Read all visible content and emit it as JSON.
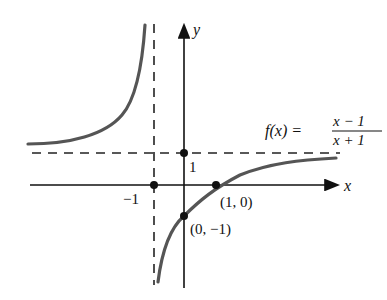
{
  "figure": {
    "function_label": "f(x) =",
    "numerator": "x − 1",
    "denominator": "x + 1",
    "x_axis_label": "x",
    "y_axis_label": "y",
    "ticks": {
      "x_minus_one": "−1",
      "y_one": "1"
    },
    "points": [
      {
        "label": "(1, 0)",
        "x": 1,
        "y": 0
      },
      {
        "label": "(0, −1)",
        "x": 0,
        "y": -1
      }
    ],
    "asymptotes": {
      "vertical": "x = −1",
      "horizontal": "y = 1"
    },
    "colors": {
      "curve": "#555555",
      "axes": "#111111",
      "asymptote": "#222222"
    }
  }
}
